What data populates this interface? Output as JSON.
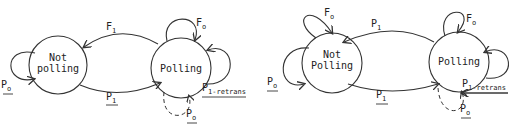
{
  "diagrams": [
    {
      "states": [
        {
          "id": "not_polling",
          "label_line1": "Not",
          "label_line2": "polling"
        },
        {
          "id": "polling",
          "label": "Polling"
        }
      ],
      "transitions": {
        "top": {
          "base": "F",
          "sub": "1"
        },
        "bottom": {
          "base": "P",
          "sub": "1",
          "underlined": true
        },
        "polling_self_top": {
          "base": "F",
          "sub": "o"
        },
        "polling_self_right": {
          "base": "P",
          "sub": "1-retrans",
          "underlined": true
        },
        "polling_self_dashed": {
          "base": "P",
          "sub": "o",
          "underlined": true
        },
        "not_polling_self": {
          "base": "P",
          "sub": "o",
          "underlined": true
        }
      }
    },
    {
      "states": [
        {
          "id": "not_polling",
          "label_line1": "Not",
          "label_line2": "Polling"
        },
        {
          "id": "polling",
          "label": "Polling"
        }
      ],
      "transitions": {
        "top": {
          "base": "P",
          "sub": "1"
        },
        "bottom": {
          "base": "P",
          "sub": "1",
          "underlined": true
        },
        "not_polling_self_top": {
          "base": "F",
          "sub": "o"
        },
        "not_polling_self_left": {
          "base": "P",
          "sub": "o",
          "underlined": true
        },
        "polling_self_top": {
          "base": "F",
          "sub": "o"
        },
        "polling_self_right": {
          "base": "P",
          "sub": "1-retrans",
          "underlined": true
        },
        "polling_self_dashed": {
          "base": "P",
          "sub": "o",
          "underlined": true
        }
      }
    }
  ]
}
